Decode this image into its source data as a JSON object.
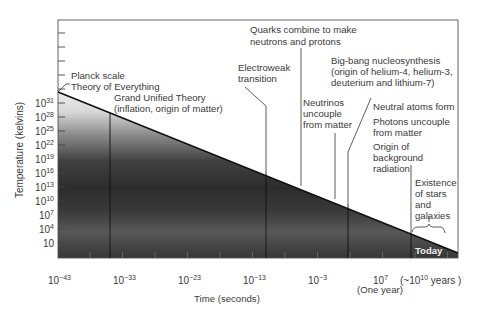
{
  "chart_data": {
    "type": "line",
    "title": "",
    "xlabel": "Time (seconds)",
    "ylabel": "Temperature (kelvins)",
    "x_scale": "log10",
    "y_scale": "log10",
    "x_ticks": [
      {
        "base": "10",
        "exp": "−43",
        "value": -43
      },
      {
        "base": "10",
        "exp": "−33",
        "value": -33
      },
      {
        "base": "10",
        "exp": "−23",
        "value": -23
      },
      {
        "base": "10",
        "exp": "−13",
        "value": -13
      },
      {
        "base": "10",
        "exp": "−3",
        "value": -3
      },
      {
        "base": "10",
        "exp": "7",
        "value": 7
      }
    ],
    "x_extra_labels": {
      "years": {
        "prefix": "(~10",
        "exp": "10",
        "suffix": " years )"
      },
      "one_year": "(One year)"
    },
    "y_ticks": [
      {
        "base": "10",
        "exp": "31",
        "value": 31
      },
      {
        "base": "10",
        "exp": "28",
        "value": 28
      },
      {
        "base": "10",
        "exp": "25",
        "value": 25
      },
      {
        "base": "10",
        "exp": "22",
        "value": 22
      },
      {
        "base": "10",
        "exp": "19",
        "value": 19
      },
      {
        "base": "10",
        "exp": "16",
        "value": 16
      },
      {
        "base": "10",
        "exp": "13",
        "value": 13
      },
      {
        "base": "10",
        "exp": "10",
        "value": 10
      },
      {
        "base": "10",
        "exp": "7",
        "value": 7
      },
      {
        "base": "10",
        "exp": "4",
        "value": 4
      },
      {
        "base": "10",
        "exp": "",
        "value": 1
      }
    ],
    "series": [
      {
        "name": "Temperature of the universe",
        "x_log": [
          -43,
          17.5
        ],
        "y_log": [
          32,
          -0.5
        ]
      }
    ],
    "events": [
      {
        "id": "planck",
        "lines": [
          "Planck scale",
          "Theory of Everything"
        ],
        "x_log": -43,
        "y_log": 32
      },
      {
        "id": "gut",
        "lines": [
          "Grand Unified Theory",
          "(inflation, origin of matter)"
        ],
        "x_log": -35,
        "y_log": 28
      },
      {
        "id": "electroweak",
        "lines": [
          "Electroweak",
          "transition"
        ],
        "x_log": -11,
        "y_log": 16
      },
      {
        "id": "quarks",
        "lines": [
          "Quarks combine to make",
          "neutrons and protons"
        ],
        "x_log": -5.5,
        "y_log": 13
      },
      {
        "id": "neutrinos",
        "lines": [
          "Neutrinos",
          "uncouple",
          "from matter"
        ],
        "x_log": -0.5,
        "y_log": 10
      },
      {
        "id": "nucleosynthesis",
        "lines": [
          "Big-bang nucleosynthesis",
          "(origin of helium-4, helium-3,",
          "deuterium and lithium-7)"
        ],
        "x_log": 1.5,
        "y_log": 9
      },
      {
        "id": "recombination",
        "lines": [
          "Neutral atoms form",
          "Photons uncouple",
          "from matter",
          "Origin of",
          "background",
          "radiation"
        ],
        "x_log": 12.5,
        "y_log": 3.5
      },
      {
        "id": "stars",
        "lines": [
          "Existence",
          "of stars",
          "and",
          "galaxies"
        ],
        "x_log": 15,
        "y_log": 2
      }
    ],
    "annotations": {
      "today": "Today"
    },
    "grid": false,
    "legend": "none"
  }
}
